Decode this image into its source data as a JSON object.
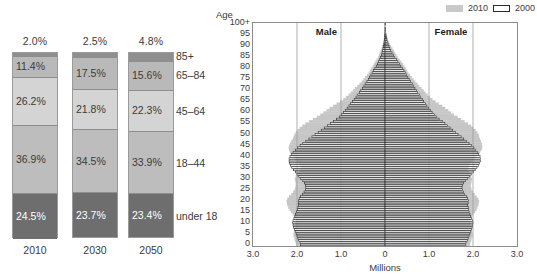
{
  "stacked": {
    "title_hidden": "",
    "groups": [
      {
        "year": "2010",
        "top_pct": "2.0%",
        "segments": [
          {
            "label": "85+",
            "pct": "2.0%",
            "value": 2.0,
            "color": "#8f8f8f",
            "show_pct": false
          },
          {
            "label": "65–84",
            "pct": "11.4%",
            "value": 11.4,
            "color": "#b9b9b9",
            "show_pct": true
          },
          {
            "label": "45–64",
            "pct": "26.2%",
            "value": 26.2,
            "color": "#d4d4d4",
            "show_pct": true
          },
          {
            "label": "18–44",
            "pct": "36.9%",
            "value": 36.9,
            "color": "#bdbdbd",
            "show_pct": true
          },
          {
            "label": "under 18",
            "pct": "24.5%",
            "value": 24.5,
            "color": "#6e6e6e",
            "show_pct": true
          }
        ]
      },
      {
        "year": "2030",
        "top_pct": "2.5%",
        "segments": [
          {
            "label": "85+",
            "pct": "2.5%",
            "value": 2.5,
            "color": "#8f8f8f",
            "show_pct": false
          },
          {
            "label": "65–84",
            "pct": "17.5%",
            "value": 17.5,
            "color": "#b9b9b9",
            "show_pct": true
          },
          {
            "label": "45–64",
            "pct": "21.8%",
            "value": 21.8,
            "color": "#d4d4d4",
            "show_pct": true
          },
          {
            "label": "18–44",
            "pct": "34.5%",
            "value": 34.5,
            "color": "#bdbdbd",
            "show_pct": true
          },
          {
            "label": "under 18",
            "pct": "23.7%",
            "value": 23.7,
            "color": "#6e6e6e",
            "show_pct": true
          }
        ]
      },
      {
        "year": "2050",
        "top_pct": "4.8%",
        "segments": [
          {
            "label": "85+",
            "pct": "4.8%",
            "value": 4.8,
            "color": "#8f8f8f",
            "show_pct": false
          },
          {
            "label": "65–84",
            "pct": "15.6%",
            "value": 15.6,
            "color": "#b9b9b9",
            "show_pct": true
          },
          {
            "label": "45–64",
            "pct": "22.3%",
            "value": 22.3,
            "color": "#d4d4d4",
            "show_pct": true
          },
          {
            "label": "18–44",
            "pct": "33.9%",
            "value": 33.9,
            "color": "#bdbdbd",
            "show_pct": true
          },
          {
            "label": "under 18",
            "pct": "23.4%",
            "value": 23.4,
            "color": "#6e6e6e",
            "show_pct": true
          }
        ]
      }
    ],
    "category_labels": [
      "85+",
      "65–84",
      "45–64",
      "18–44",
      "under 18"
    ]
  },
  "pyramid": {
    "age_axis_caption": "Age",
    "x_axis_caption": "Millions",
    "male_label": "Male",
    "female_label": "Female",
    "legend": [
      {
        "label": "2010",
        "swatch": "filled-gray"
      },
      {
        "label": "2000",
        "swatch": "outline-white"
      }
    ],
    "y_ticks": [
      "100+",
      "95",
      "90",
      "85",
      "80",
      "75",
      "70",
      "65",
      "60",
      "55",
      "50",
      "45",
      "40",
      "35",
      "30",
      "25",
      "20",
      "15",
      "10",
      "5",
      "0"
    ],
    "x_ticks": [
      "3.0",
      "2.0",
      "1.0",
      "0",
      "1.0",
      "2.0",
      "3.0"
    ],
    "colors": {
      "fill_2010": "#c6c6c6",
      "outline_2000": "#2f2f2f",
      "frame": "#8c8c8c",
      "grid": "#9d9d9d"
    }
  },
  "chart_data": [
    {
      "type": "bar",
      "title": "Percent distribution of the population by age group",
      "orientation": "vertical-stacked-100",
      "categories": [
        "2010",
        "2030",
        "2050"
      ],
      "xlabel": "",
      "ylabel": "Percent of population",
      "ylim": [
        0,
        100
      ],
      "grid": false,
      "legend_position": "right-labels",
      "series": [
        {
          "name": "under 18",
          "values": [
            24.5,
            23.7,
            23.4
          ]
        },
        {
          "name": "18–44",
          "values": [
            36.9,
            34.5,
            33.9
          ]
        },
        {
          "name": "45–64",
          "values": [
            26.2,
            21.8,
            22.3
          ]
        },
        {
          "name": "65–84",
          "values": [
            11.4,
            17.5,
            15.6
          ]
        },
        {
          "name": "85+",
          "values": [
            2.0,
            2.5,
            4.8
          ]
        }
      ]
    },
    {
      "type": "bar",
      "subtype": "population-pyramid",
      "title": "Population by age and sex, 2000 and 2010",
      "xlabel": "Millions",
      "ylabel": "Age",
      "xlim": [
        -3.0,
        3.0
      ],
      "ylim": [
        0,
        100
      ],
      "grid": true,
      "legend_position": "top-right",
      "ages": [
        0,
        1,
        2,
        3,
        4,
        5,
        6,
        7,
        8,
        9,
        10,
        11,
        12,
        13,
        14,
        15,
        16,
        17,
        18,
        19,
        20,
        21,
        22,
        23,
        24,
        25,
        26,
        27,
        28,
        29,
        30,
        31,
        32,
        33,
        34,
        35,
        36,
        37,
        38,
        39,
        40,
        41,
        42,
        43,
        44,
        45,
        46,
        47,
        48,
        49,
        50,
        51,
        52,
        53,
        54,
        55,
        56,
        57,
        58,
        59,
        60,
        61,
        62,
        63,
        64,
        65,
        66,
        67,
        68,
        69,
        70,
        71,
        72,
        73,
        74,
        75,
        76,
        77,
        78,
        79,
        80,
        81,
        82,
        83,
        84,
        85,
        86,
        87,
        88,
        89,
        90,
        91,
        92,
        93,
        94,
        95,
        96,
        97,
        98,
        99,
        100
      ],
      "series": [
        {
          "name": "2010",
          "sex": "male",
          "values": [
            2.02,
            2.03,
            2.05,
            2.06,
            2.08,
            2.08,
            2.07,
            2.06,
            2.05,
            2.04,
            2.03,
            2.03,
            2.04,
            2.07,
            2.1,
            2.14,
            2.17,
            2.2,
            2.22,
            2.23,
            2.24,
            2.22,
            2.18,
            2.13,
            2.09,
            2.06,
            2.04,
            2.03,
            2.03,
            2.04,
            2.05,
            2.03,
            2.0,
            1.96,
            1.93,
            1.92,
            1.93,
            1.96,
            2.0,
            2.04,
            2.08,
            2.12,
            2.16,
            2.18,
            2.19,
            2.18,
            2.16,
            2.13,
            2.1,
            2.08,
            2.06,
            2.03,
            1.99,
            1.94,
            1.88,
            1.81,
            1.73,
            1.64,
            1.55,
            1.47,
            1.4,
            1.33,
            1.26,
            1.18,
            1.1,
            1.02,
            0.95,
            0.89,
            0.83,
            0.78,
            0.73,
            0.68,
            0.63,
            0.58,
            0.53,
            0.49,
            0.45,
            0.41,
            0.37,
            0.34,
            0.31,
            0.28,
            0.25,
            0.22,
            0.19,
            0.16,
            0.14,
            0.12,
            0.1,
            0.08,
            0.07,
            0.05,
            0.04,
            0.03,
            0.025,
            0.02,
            0.015,
            0.01,
            0.008,
            0.005,
            0.004
          ]
        },
        {
          "name": "2010",
          "sex": "female",
          "values": [
            1.93,
            1.94,
            1.96,
            1.97,
            1.99,
            1.99,
            1.98,
            1.97,
            1.96,
            1.95,
            1.94,
            1.94,
            1.95,
            1.98,
            2.01,
            2.05,
            2.08,
            2.1,
            2.12,
            2.13,
            2.14,
            2.12,
            2.08,
            2.04,
            2.0,
            1.97,
            1.96,
            1.95,
            1.96,
            1.97,
            1.98,
            1.96,
            1.94,
            1.91,
            1.89,
            1.89,
            1.91,
            1.94,
            1.98,
            2.03,
            2.07,
            2.12,
            2.16,
            2.19,
            2.21,
            2.21,
            2.2,
            2.18,
            2.16,
            2.14,
            2.13,
            2.1,
            2.06,
            2.01,
            1.96,
            1.89,
            1.81,
            1.73,
            1.65,
            1.57,
            1.5,
            1.44,
            1.37,
            1.3,
            1.22,
            1.15,
            1.08,
            1.02,
            0.97,
            0.92,
            0.88,
            0.83,
            0.78,
            0.74,
            0.69,
            0.65,
            0.61,
            0.57,
            0.53,
            0.5,
            0.47,
            0.44,
            0.41,
            0.37,
            0.33,
            0.29,
            0.26,
            0.23,
            0.2,
            0.17,
            0.14,
            0.11,
            0.09,
            0.07,
            0.055,
            0.04,
            0.03,
            0.022,
            0.016,
            0.011,
            0.012
          ]
        },
        {
          "name": "2000",
          "sex": "male",
          "values": [
            1.92,
            1.93,
            1.96,
            1.98,
            2.0,
            2.02,
            2.04,
            2.06,
            2.08,
            2.09,
            2.1,
            2.09,
            2.07,
            2.05,
            2.03,
            2.01,
            1.99,
            1.98,
            1.97,
            1.97,
            1.97,
            1.95,
            1.92,
            1.88,
            1.84,
            1.81,
            1.8,
            1.81,
            1.83,
            1.87,
            1.92,
            1.96,
            2.0,
            2.04,
            2.08,
            2.12,
            2.15,
            2.17,
            2.18,
            2.18,
            2.16,
            2.13,
            2.09,
            2.04,
            1.99,
            1.93,
            1.87,
            1.8,
            1.73,
            1.66,
            1.59,
            1.52,
            1.45,
            1.38,
            1.31,
            1.24,
            1.17,
            1.1,
            1.04,
            0.99,
            0.94,
            0.9,
            0.86,
            0.82,
            0.78,
            0.74,
            0.7,
            0.66,
            0.62,
            0.58,
            0.55,
            0.51,
            0.48,
            0.45,
            0.41,
            0.38,
            0.35,
            0.32,
            0.29,
            0.26,
            0.23,
            0.2,
            0.17,
            0.15,
            0.12,
            0.1,
            0.08,
            0.07,
            0.055,
            0.045,
            0.035,
            0.027,
            0.02,
            0.015,
            0.011,
            0.008,
            0.006,
            0.004,
            0.003,
            0.002,
            0.002
          ]
        },
        {
          "name": "2000",
          "sex": "female",
          "values": [
            1.83,
            1.84,
            1.87,
            1.89,
            1.91,
            1.93,
            1.95,
            1.97,
            1.98,
            1.99,
            2.0,
            1.99,
            1.97,
            1.95,
            1.93,
            1.91,
            1.9,
            1.89,
            1.88,
            1.89,
            1.9,
            1.88,
            1.85,
            1.81,
            1.78,
            1.76,
            1.75,
            1.76,
            1.79,
            1.83,
            1.88,
            1.92,
            1.96,
            2.01,
            2.05,
            2.09,
            2.12,
            2.15,
            2.17,
            2.17,
            2.16,
            2.13,
            2.1,
            2.06,
            2.02,
            1.97,
            1.91,
            1.85,
            1.79,
            1.73,
            1.66,
            1.6,
            1.54,
            1.48,
            1.42,
            1.36,
            1.3,
            1.23,
            1.17,
            1.12,
            1.07,
            1.03,
            0.99,
            0.95,
            0.92,
            0.88,
            0.85,
            0.81,
            0.78,
            0.74,
            0.71,
            0.68,
            0.65,
            0.62,
            0.58,
            0.55,
            0.52,
            0.49,
            0.46,
            0.43,
            0.4,
            0.36,
            0.33,
            0.29,
            0.26,
            0.22,
            0.19,
            0.16,
            0.13,
            0.11,
            0.09,
            0.07,
            0.055,
            0.04,
            0.03,
            0.022,
            0.016,
            0.012,
            0.008,
            0.006,
            0.007
          ]
        }
      ]
    }
  ]
}
